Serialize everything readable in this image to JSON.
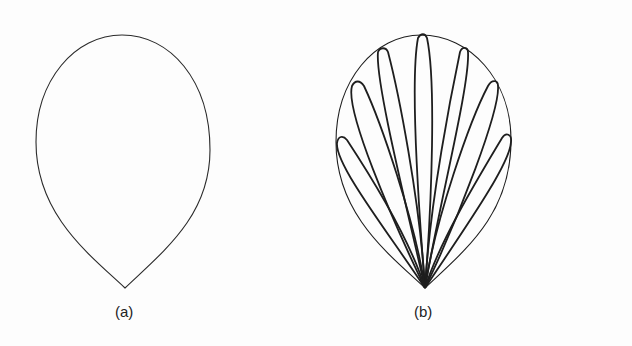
{
  "figures": [
    {
      "id": "a",
      "caption": "(a)",
      "description": "teardrop / pointed-egg outline"
    },
    {
      "id": "b",
      "caption": "(b)",
      "description": "teardrop outline filled with fan of 9 elongated lobes converging at bottom tip"
    }
  ],
  "colors": {
    "stroke": "#2a2a2a",
    "background": "#fdfdfd"
  }
}
